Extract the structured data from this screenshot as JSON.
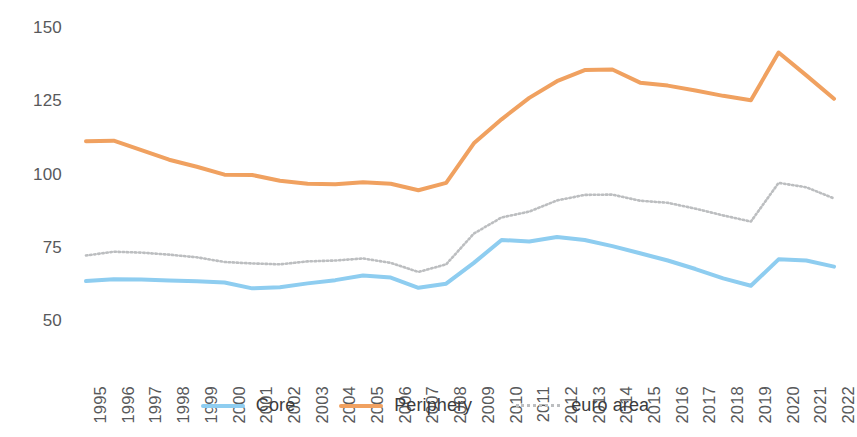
{
  "chart_data": {
    "type": "line",
    "title": "",
    "subtitle": "",
    "xlabel": "",
    "ylabel": "",
    "grid": false,
    "legend_position": "bottom",
    "ylim": [
      50,
      150
    ],
    "yticks": [
      50,
      75,
      100,
      125,
      150
    ],
    "ytick_labels": [
      "50",
      "75",
      "100",
      "125",
      "150"
    ],
    "categories": [
      "1995",
      "1996",
      "1997",
      "1998",
      "1999",
      "2000",
      "2001",
      "2002",
      "2003",
      "2004",
      "2005",
      "2006",
      "2007",
      "2008",
      "2009",
      "2010",
      "2011",
      "2012",
      "2013",
      "2014",
      "2015",
      "2016",
      "2017",
      "2018",
      "2019",
      "2020",
      "2021",
      "2022"
    ],
    "series": [
      {
        "name": "Core",
        "color": "#8ecdf0",
        "style": "solid",
        "values": [
          63.3,
          63.9,
          63.8,
          63.5,
          63.2,
          62.8,
          60.8,
          61.2,
          62.5,
          63.6,
          65.2,
          64.5,
          61.0,
          62.4,
          69.5,
          77.3,
          76.8,
          78.3,
          77.3,
          75.2,
          72.8,
          70.3,
          67.4,
          64.2,
          61.7,
          70.7,
          70.3,
          68.2
        ]
      },
      {
        "name": "Periphery",
        "color": "#f0a160",
        "style": "solid",
        "values": [
          111.0,
          111.2,
          108.0,
          104.7,
          102.3,
          99.6,
          99.5,
          97.5,
          96.5,
          96.3,
          97.0,
          96.5,
          94.3,
          96.8,
          110.3,
          118.5,
          125.8,
          131.5,
          135.3,
          135.5,
          131.0,
          130.0,
          128.3,
          126.5,
          125.0,
          141.3,
          133.5,
          125.5
        ]
      },
      {
        "name": "euro area",
        "color": "#bcbec0",
        "style": "dotted",
        "values": [
          72.0,
          73.3,
          73.0,
          72.3,
          71.4,
          69.8,
          69.3,
          69.0,
          70.0,
          70.3,
          71.0,
          69.5,
          66.4,
          69.0,
          79.5,
          85.0,
          87.0,
          90.8,
          92.7,
          92.8,
          90.7,
          90.0,
          88.0,
          85.7,
          83.6,
          96.8,
          95.3,
          91.5
        ]
      }
    ]
  },
  "legend": {
    "items": [
      {
        "label": "Core",
        "color": "#8ecdf0",
        "style": "solid"
      },
      {
        "label": "Periphery",
        "color": "#f0a160",
        "style": "solid"
      },
      {
        "label": "euro area",
        "color": "#bcbec0",
        "style": "dotted"
      }
    ]
  }
}
